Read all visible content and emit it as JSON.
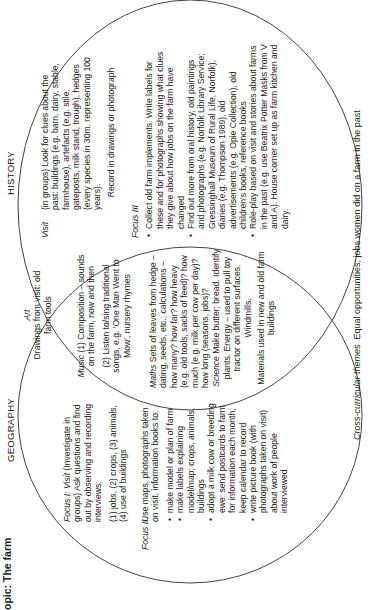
{
  "title": "opic: The farm",
  "circles": {
    "geography": {
      "label": "GEOGRAPHY"
    },
    "history": {
      "label": "HISTORY"
    }
  },
  "geography": {
    "focus1_label": "Focus I: Visit",
    "focus1_text": "(Investigate in groups) Ask questions and find out by observing and recording interviews:",
    "focus1_items": "(1) jobs, (2) crops, (3) animals, (4) use of buildings",
    "focus2_label": "Focus II",
    "focus2_intro": "Use maps, photographs taken on visit, information books to:",
    "focus2_bullets": [
      "make model or plan of farm",
      "make labels explaining model/map; crops, animals, buildings",
      "adopt a milk cow or breeding ewe: send postcards to farm for information each month, keep calendar to record",
      "write picture book (with photographs taken on visit) about work of people interviewed"
    ]
  },
  "overlap": {
    "art_label": "Art",
    "art_text": "Drawings from visit: old farm tools",
    "music_label": "Music",
    "music_text": "(1) Composition – sounds on the farm, now and then",
    "music_text2": "(2) Listen to/sing traditional songs, e.g. 'One Man Went to Mow', nursery rhymes",
    "maths_label": "Maths",
    "maths_text": "Sets of leaves from hedge – dating, seeds, etc.; calculations – how many? how far? how heavy (e.g. old tools, sacks of feed)? how much (e.g. milk per cow per day)? how long (seasons, jobs)?",
    "science_label": "Science",
    "science_text": "Make butter; bread. Identify plants. Energy – used to pull toy tractor on different surfaces. Windmills.",
    "materials_text": "Materials used in new and old farm buildings"
  },
  "history": {
    "visit_label": "Visit",
    "visit_text": "(in groups) Look for clues about the past: buildings (e.g. barn, dairy, stable, farmhouse), artefacts (e.g. stile, gateposts, milk stand, trough), hedges (every species in 30m. representing 100 years).",
    "visit_record": "Record in drawings or photograph",
    "focus3_label": "Focus III",
    "focus3_bullets": [
      "Collect old farm implements. Write labels for these and for photographs showing what clues they give about how jobs on the farm have changed",
      "Find out more from oral history, old paintings and photographs (e.g. Norfolk Library Service; Gressinghall Museum of Rural Life, Norfolk), diaries (e.g. Thompson 1989), old advertisements (e.g. Opie Collection), old children's books, reference books",
      "Role-play based on visit and stories about farms in the past (e.g. use Beatrix Potter Masks from V and A). House corner set up as farm kitchen and dairy."
    ]
  },
  "footer": {
    "label": "Cross-curricular themes",
    "text": "Equal opportunities; jobs women did on a farm in the past"
  },
  "colors": {
    "line": "#444444",
    "text": "#222222",
    "background": "#ffffff"
  }
}
